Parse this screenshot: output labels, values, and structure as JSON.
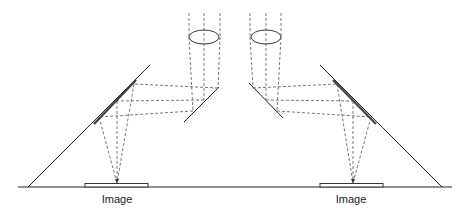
{
  "diagram": {
    "title": "",
    "labels": {
      "left_image": "Image",
      "right_image": "Image"
    },
    "colors": {
      "line": "#222222",
      "dashed": "#555555",
      "background": "#ffffff"
    },
    "components": [
      "lens",
      "small-mirror",
      "large-mirror",
      "ground-plane",
      "image-plate"
    ],
    "symmetric": true
  }
}
